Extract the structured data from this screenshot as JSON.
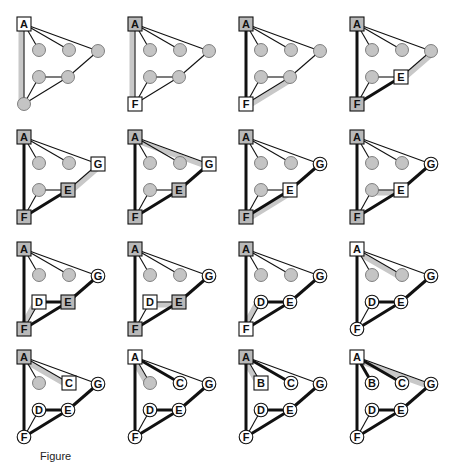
{
  "figure": {
    "caption": "Figure"
  },
  "colors": {
    "node_gray": "#c4c4c4",
    "box_gray": "#b9b9b9",
    "box_white": "#ffffff",
    "edge": "#111111",
    "highlight": "#c8c8c8",
    "background": "#ffffff"
  },
  "layout": {
    "col_x": [
      24,
      135,
      246,
      357
    ],
    "row_y": [
      24,
      137,
      249,
      357
    ]
  },
  "nodes": {
    "A": [
      0,
      0
    ],
    "B": [
      15,
      26
    ],
    "C": [
      45,
      26
    ],
    "G": [
      74,
      27
    ],
    "D": [
      15,
      53
    ],
    "E": [
      44,
      53
    ],
    "F": [
      0,
      80
    ]
  },
  "edges": [
    [
      "A",
      "B"
    ],
    [
      "A",
      "C"
    ],
    [
      "A",
      "G"
    ],
    [
      "A",
      "F"
    ],
    [
      "D",
      "E"
    ],
    [
      "D",
      "F"
    ],
    [
      "E",
      "F"
    ],
    [
      "E",
      "G"
    ]
  ],
  "panels": [
    {
      "states": {
        "A": "box-white",
        "B": "gray",
        "C": "gray",
        "G": "gray",
        "D": "gray",
        "E": "gray",
        "F": "gray"
      },
      "thick": [],
      "highlight": [
        [
          "A",
          "F"
        ]
      ]
    },
    {
      "states": {
        "A": "box-gray",
        "B": "gray",
        "C": "gray",
        "G": "gray",
        "D": "gray",
        "E": "gray",
        "F": "box-white"
      },
      "thick": [],
      "highlight": [
        [
          "A",
          "F"
        ]
      ]
    },
    {
      "states": {
        "A": "box-gray",
        "B": "gray",
        "C": "gray",
        "G": "gray",
        "D": "gray",
        "E": "gray",
        "F": "box-white"
      },
      "thick": [
        [
          "A",
          "F"
        ]
      ],
      "highlight": [
        [
          "F",
          "E"
        ]
      ]
    },
    {
      "states": {
        "A": "box-gray",
        "B": "gray",
        "C": "gray",
        "G": "gray",
        "D": "gray",
        "E": "box-white",
        "F": "box-gray"
      },
      "thick": [
        [
          "A",
          "F"
        ],
        [
          "F",
          "E"
        ]
      ],
      "highlight": [
        [
          "E",
          "G"
        ]
      ]
    },
    {
      "states": {
        "A": "box-gray",
        "B": "gray",
        "C": "gray",
        "G": "box-white",
        "D": "gray",
        "E": "box-gray",
        "F": "box-gray"
      },
      "thick": [
        [
          "A",
          "F"
        ],
        [
          "F",
          "E"
        ]
      ],
      "highlight": [
        [
          "E",
          "G"
        ]
      ]
    },
    {
      "states": {
        "A": "box-gray",
        "B": "gray",
        "C": "gray",
        "G": "box-white",
        "D": "gray",
        "E": "box-gray",
        "F": "box-gray"
      },
      "thick": [
        [
          "A",
          "F"
        ],
        [
          "F",
          "E"
        ],
        [
          "E",
          "G"
        ]
      ],
      "highlight": [
        [
          "A",
          "G"
        ]
      ]
    },
    {
      "states": {
        "A": "box-gray",
        "B": "gray",
        "C": "gray",
        "G": "circle",
        "D": "gray",
        "E": "box-white",
        "F": "box-gray"
      },
      "thick": [
        [
          "A",
          "F"
        ],
        [
          "F",
          "E"
        ],
        [
          "E",
          "G"
        ]
      ],
      "highlight": [
        [
          "F",
          "E"
        ]
      ]
    },
    {
      "states": {
        "A": "box-gray",
        "B": "gray",
        "C": "gray",
        "G": "circle",
        "D": "gray",
        "E": "box-white",
        "F": "box-gray"
      },
      "thick": [
        [
          "A",
          "F"
        ],
        [
          "F",
          "E"
        ],
        [
          "E",
          "G"
        ]
      ],
      "highlight": [
        [
          "D",
          "E"
        ]
      ]
    },
    {
      "states": {
        "A": "box-gray",
        "B": "gray",
        "C": "gray",
        "G": "circle",
        "D": "box-white",
        "E": "box-gray",
        "F": "box-gray"
      },
      "thick": [
        [
          "A",
          "F"
        ],
        [
          "F",
          "E"
        ],
        [
          "E",
          "G"
        ],
        [
          "D",
          "E"
        ]
      ],
      "highlight": [
        [
          "D",
          "F"
        ]
      ]
    },
    {
      "states": {
        "A": "box-gray",
        "B": "gray",
        "C": "gray",
        "G": "circle",
        "D": "box-white",
        "E": "box-gray",
        "F": "box-gray"
      },
      "thick": [
        [
          "A",
          "F"
        ],
        [
          "F",
          "E"
        ],
        [
          "E",
          "G"
        ]
      ],
      "highlight": [
        [
          "D",
          "E"
        ]
      ]
    },
    {
      "states": {
        "A": "box-gray",
        "B": "gray",
        "C": "gray",
        "G": "circle",
        "D": "circle",
        "E": "circle",
        "F": "box-white"
      },
      "thick": [
        [
          "A",
          "F"
        ],
        [
          "F",
          "E"
        ],
        [
          "E",
          "G"
        ],
        [
          "D",
          "E"
        ]
      ],
      "highlight": [
        [
          "D",
          "F"
        ]
      ]
    },
    {
      "states": {
        "A": "box-white",
        "B": "gray",
        "C": "gray",
        "G": "circle",
        "D": "circle",
        "E": "circle",
        "F": "circle"
      },
      "thick": [
        [
          "A",
          "F"
        ],
        [
          "F",
          "E"
        ],
        [
          "E",
          "G"
        ],
        [
          "D",
          "E"
        ]
      ],
      "highlight": [
        [
          "A",
          "C"
        ]
      ]
    },
    {
      "states": {
        "A": "box-gray",
        "B": "gray",
        "C": "box-white",
        "G": "circle",
        "D": "circle",
        "E": "circle",
        "F": "circle"
      },
      "thick": [
        [
          "A",
          "F"
        ],
        [
          "F",
          "E"
        ],
        [
          "E",
          "G"
        ],
        [
          "D",
          "E"
        ]
      ],
      "highlight": [
        [
          "A",
          "C"
        ]
      ]
    },
    {
      "states": {
        "A": "box-white",
        "B": "gray",
        "C": "circle",
        "G": "circle",
        "D": "circle",
        "E": "circle",
        "F": "circle"
      },
      "thick": [
        [
          "A",
          "F"
        ],
        [
          "F",
          "E"
        ],
        [
          "E",
          "G"
        ],
        [
          "D",
          "E"
        ],
        [
          "A",
          "C"
        ]
      ],
      "highlight": [
        [
          "A",
          "B"
        ]
      ]
    },
    {
      "states": {
        "A": "box-gray",
        "B": "box-white",
        "C": "circle",
        "G": "circle",
        "D": "circle",
        "E": "circle",
        "F": "circle"
      },
      "thick": [
        [
          "A",
          "F"
        ],
        [
          "F",
          "E"
        ],
        [
          "E",
          "G"
        ],
        [
          "D",
          "E"
        ],
        [
          "A",
          "C"
        ]
      ],
      "highlight": [
        [
          "A",
          "B"
        ]
      ]
    },
    {
      "states": {
        "A": "box-white",
        "B": "circle",
        "C": "circle",
        "G": "circle",
        "D": "circle",
        "E": "circle",
        "F": "circle"
      },
      "thick": [
        [
          "A",
          "F"
        ],
        [
          "F",
          "E"
        ],
        [
          "E",
          "G"
        ],
        [
          "D",
          "E"
        ],
        [
          "A",
          "C"
        ],
        [
          "A",
          "B"
        ]
      ],
      "highlight": [
        [
          "A",
          "G"
        ]
      ]
    }
  ]
}
